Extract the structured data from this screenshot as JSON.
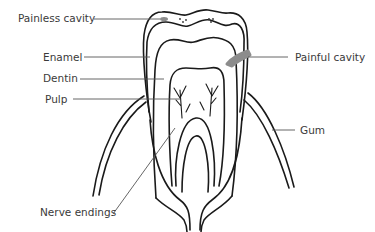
{
  "diagram": {
    "labels": {
      "painless_cavity": "Painless cavity",
      "enamel": "Enamel",
      "dentin": "Dentin",
      "pulp": "Pulp",
      "painful_cavity": "Painful cavity",
      "gum": "Gum",
      "nerve_endings": "Nerve endings"
    },
    "colors": {
      "outline": "#1a1a1a",
      "cavity": "#8c8c8c",
      "leader_line": "#555555",
      "text": "#3a3a3a",
      "background": "#ffffff"
    }
  }
}
